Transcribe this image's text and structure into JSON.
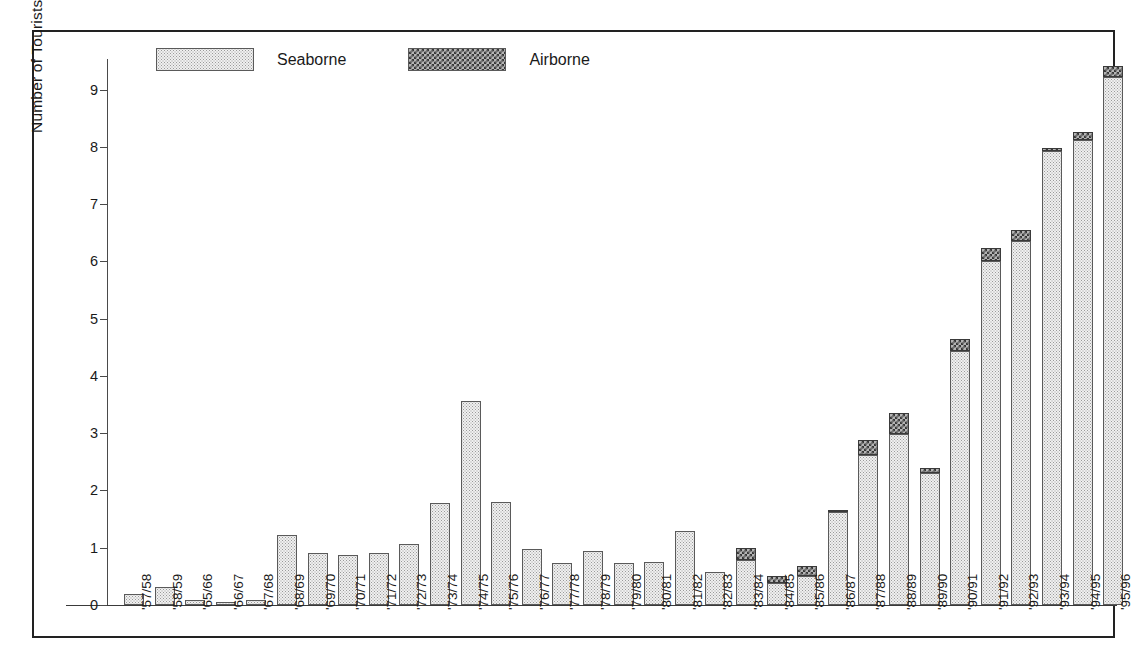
{
  "chart_data": {
    "type": "bar",
    "stacked": true,
    "title": "",
    "xlabel": "",
    "ylabel": "Number of Tourists (thousands)",
    "ylim": [
      0,
      9.5
    ],
    "yticks": [
      0,
      1,
      2,
      3,
      4,
      5,
      6,
      7,
      8,
      9
    ],
    "grid": false,
    "legend_position": "top-left-inside",
    "categories": [
      "'57/58",
      "'58/59",
      "'65/66",
      "'66/67",
      "'67/68",
      "'68/69",
      "'69/70",
      "'70/71",
      "'71/72",
      "'72/73",
      "'73/74",
      "'74/75",
      "'75/76",
      "'76/77",
      "'77/78",
      "'78/79",
      "'79/80",
      "'80/81",
      "'81/82",
      "'82/83",
      "'83/84",
      "'84/85",
      "'85/86",
      "'86/87",
      "'87/88",
      "'88/89",
      "'89/90",
      "'90/91",
      "'91/92",
      "'92/93",
      "'93/94",
      "'94/95",
      "'95/96"
    ],
    "series": [
      {
        "name": "Seaborne",
        "fill": "light-dotted",
        "values": [
          0.19,
          0.31,
          0.08,
          0.06,
          0.09,
          1.22,
          0.91,
          0.88,
          0.91,
          1.07,
          1.79,
          3.56,
          1.8,
          0.97,
          0.74,
          0.95,
          0.74,
          0.75,
          1.29,
          0.58,
          0.78,
          0.38,
          0.5,
          1.63,
          2.62,
          2.99,
          2.3,
          4.44,
          6.01,
          6.35,
          7.93,
          8.13,
          9.22
        ]
      },
      {
        "name": "Airborne",
        "fill": "dark-checkered",
        "values": [
          0,
          0,
          0,
          0,
          0,
          0,
          0,
          0,
          0,
          0,
          0,
          0,
          0,
          0,
          0,
          0,
          0,
          0,
          0,
          0,
          0.22,
          0.12,
          0.18,
          0.02,
          0.27,
          0.37,
          0.09,
          0.21,
          0.22,
          0.2,
          0.05,
          0.13,
          0.19
        ]
      }
    ],
    "totals": [
      0.19,
      0.31,
      0.08,
      0.06,
      0.09,
      1.22,
      0.91,
      0.88,
      0.91,
      1.07,
      1.79,
      3.56,
      1.8,
      0.97,
      0.74,
      0.95,
      0.74,
      0.75,
      1.29,
      0.58,
      1.0,
      0.5,
      0.68,
      1.65,
      2.89,
      3.36,
      2.39,
      4.65,
      6.23,
      6.55,
      7.98,
      8.26,
      9.41
    ]
  },
  "legend": {
    "items": [
      {
        "label": "Seaborne"
      },
      {
        "label": "Airborne"
      }
    ]
  },
  "colors": {
    "seaborne_fill": "#f0f0f0",
    "seaborne_pattern": "#9a9a9a",
    "airborne_fill": "#b4b4b4",
    "airborne_pattern": "#383838",
    "axis": "#3a3a3a",
    "border": "#222222",
    "text": "#1a1a1a"
  }
}
